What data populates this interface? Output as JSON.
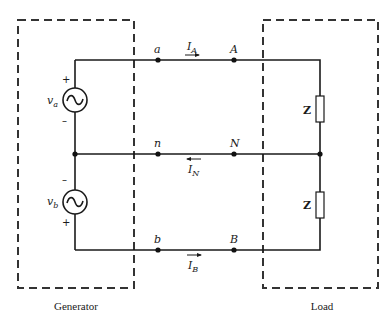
{
  "diagram": {
    "type": "three-wire single-phase circuit",
    "generator": {
      "label": "Generator",
      "sources": [
        {
          "name": "va",
          "symbol": "v",
          "subscript": "a",
          "plus": "+",
          "minus": "–"
        },
        {
          "name": "vb",
          "symbol": "v",
          "subscript": "b",
          "plus": "+",
          "minus": "–"
        }
      ]
    },
    "load": {
      "label": "Load",
      "impedances": [
        {
          "label": "Z"
        },
        {
          "label": "Z"
        }
      ]
    },
    "nodes": {
      "a": "a",
      "A": "A",
      "n": "n",
      "N": "N",
      "b": "b",
      "B": "B"
    },
    "currents": [
      {
        "symbol": "I",
        "subscript": "A",
        "direction": "right"
      },
      {
        "symbol": "I",
        "subscript": "N",
        "direction": "left"
      },
      {
        "symbol": "I",
        "subscript": "B",
        "direction": "right"
      }
    ]
  }
}
